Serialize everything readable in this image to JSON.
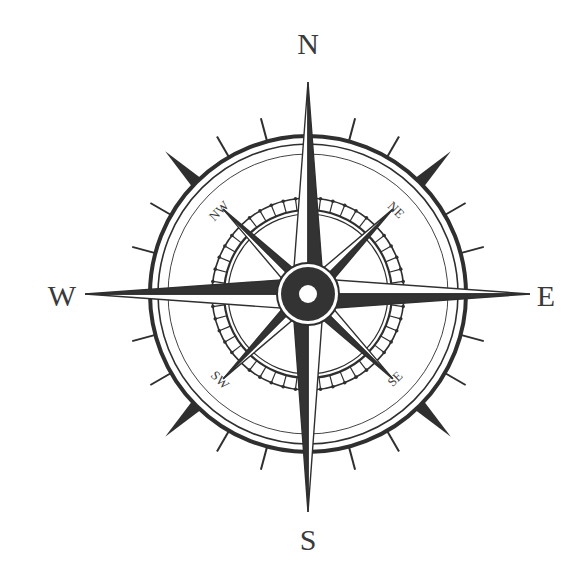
{
  "compass": {
    "center": [
      308,
      294
    ],
    "colors": {
      "ink": "#2f2f2f",
      "dark_fill": "#333333",
      "light_fill": "#ffffff",
      "background": "#ffffff"
    },
    "rings": {
      "outer_thick": 158,
      "outer_thin": 150,
      "outer_hair": 140,
      "band_outer": 96,
      "band_inner": 84,
      "band_inner2": 80
    },
    "hub": {
      "outer": 31,
      "dark": 27,
      "inner": 9
    },
    "ticks": {
      "step_deg": 15,
      "short_len": 24,
      "long_len": 44
    },
    "cardinal_points": [
      {
        "name": "N",
        "angle": 0,
        "length": 212,
        "half_width": 16
      },
      {
        "name": "E",
        "angle": 90,
        "length": 222,
        "half_width": 16
      },
      {
        "name": "S",
        "angle": 180,
        "length": 218,
        "half_width": 16
      },
      {
        "name": "W",
        "angle": 270,
        "length": 223,
        "half_width": 16
      }
    ],
    "intercardinal_points": [
      {
        "name": "NE",
        "angle": 45,
        "length": 120,
        "half_width": 10
      },
      {
        "name": "SE",
        "angle": 135,
        "length": 120,
        "half_width": 10
      },
      {
        "name": "SW",
        "angle": 225,
        "length": 120,
        "half_width": 10
      },
      {
        "name": "NW",
        "angle": 315,
        "length": 120,
        "half_width": 10
      }
    ],
    "labels": {
      "north": "N",
      "east": "E",
      "south": "S",
      "west": "W",
      "northeast": "NE",
      "southeast": "SE",
      "southwest": "SW",
      "northwest": "NW"
    }
  }
}
